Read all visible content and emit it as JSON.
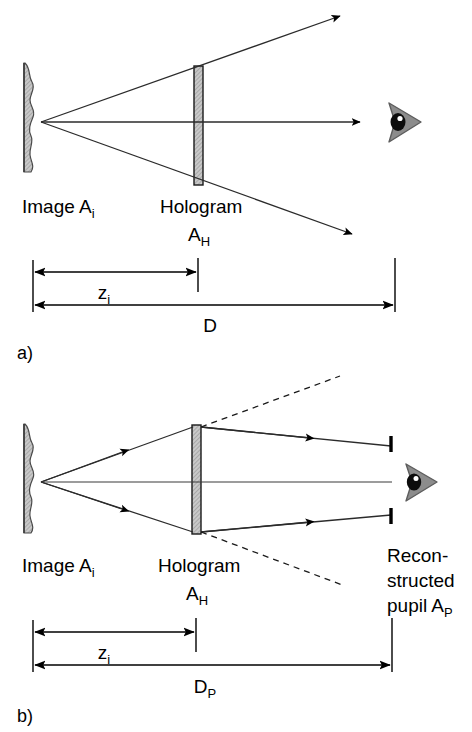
{
  "figure": {
    "type": "optical-ray-diagram",
    "background_color": "#ffffff",
    "ink_color": "#000000",
    "hatch_fill_color": "#b0b0b0",
    "eye_fill_color": "#8c8c8c",
    "panels": [
      {
        "id": "a",
        "caption": "a)",
        "labels": {
          "image": "Image A",
          "image_sub": "i",
          "hologram": "Hologram",
          "hologram_symbol": "A",
          "hologram_symbol_sub": "H",
          "dim_near": "z",
          "dim_near_sub": "i",
          "dim_far": "D",
          "dim_far_sub": ""
        },
        "elements": [
          "diffuse-image-screen",
          "hologram-plate",
          "upper-ray",
          "axis-ray",
          "lower-ray",
          "eye-icon",
          "dimension-zi",
          "dimension-D"
        ]
      },
      {
        "id": "b",
        "caption": "b)",
        "labels": {
          "image": "Image A",
          "image_sub": "i",
          "hologram": "Hologram",
          "hologram_symbol": "A",
          "hologram_symbol_sub": "H",
          "pupil_line1": "Recon-",
          "pupil_line2": "structed",
          "pupil_line3": "pupil A",
          "pupil_line3_sub": "P",
          "dim_near": "z",
          "dim_near_sub": "i",
          "dim_far": "D",
          "dim_far_sub": "P"
        },
        "elements": [
          "diffuse-image-screen",
          "hologram-plate",
          "upper-ray-in",
          "lower-ray-in",
          "upper-ray-out",
          "lower-ray-out",
          "axis-ray",
          "dashed-extension-upper",
          "dashed-extension-lower",
          "pupil-marker-top",
          "pupil-marker-bottom",
          "eye-icon",
          "dimension-zi",
          "dimension-Dp"
        ]
      }
    ]
  }
}
